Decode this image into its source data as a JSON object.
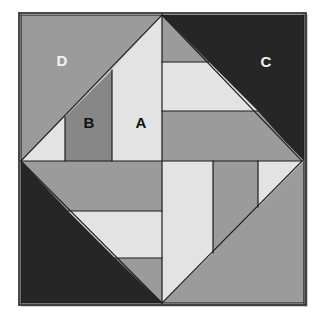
{
  "figure": {
    "canvas": {
      "width": 327,
      "height": 322,
      "background": "#ffffff"
    },
    "frame": {
      "name": "outer-square-border",
      "x": 19,
      "y": 13,
      "width": 287,
      "height": 292,
      "stroke": "#1c1c1c",
      "stroke_width": 1.6,
      "shadow": "#cfcfcf"
    },
    "palette": {
      "dark": "#262626",
      "medium_gray": "#9b9b9b",
      "mid_dark_gray": "#878787",
      "light": "#e3e3e3",
      "outline": "#1c1c1c",
      "label_light": "#f2f2f2",
      "label_dark": "#111111",
      "page_background": "#ffffff"
    },
    "diamond": {
      "name": "inner-rotated-square",
      "top": [
        162,
        15
      ],
      "left": [
        21,
        161
      ],
      "right": [
        302,
        161
      ],
      "bottom": [
        162,
        303
      ]
    },
    "corner_triangles": [
      {
        "name": "corner-triangle-upper-left",
        "label": "D",
        "fill": "#9b9b9b",
        "points": "21,15 162,15 21,161",
        "label_x": 62,
        "label_y": 62,
        "label_color": "#f2f2f2"
      },
      {
        "name": "corner-triangle-upper-right",
        "label": "C",
        "fill": "#262626",
        "points": "162,15 304,15 304,161",
        "label_x": 266,
        "label_y": 63,
        "label_color": "#f2f2f2"
      },
      {
        "name": "corner-triangle-lower-left",
        "label": "",
        "fill": "#262626",
        "points": "21,161 162,303 21,303",
        "label_x": 62,
        "label_y": 258,
        "label_color": "#f2f2f2"
      },
      {
        "name": "corner-triangle-lower-right",
        "label": "",
        "fill": "#9b9b9b",
        "points": "304,161 304,303 162,303",
        "label_x": 264,
        "label_y": 258,
        "label_color": "#111111"
      }
    ],
    "quadrant_pieces": [
      {
        "name": "piece-upper-left-outer-triangle",
        "label": "",
        "fill": "#e3e3e3",
        "points": "21,161 65,117 65,161",
        "label_x": 0,
        "label_y": 0,
        "label_color": "#111111"
      },
      {
        "name": "piece-upper-left-b",
        "label": "B",
        "fill": "#878787",
        "points": "65,117 112,70 112,161 65,161",
        "label_x": 89,
        "label_y": 124,
        "label_color": "#111111"
      },
      {
        "name": "piece-upper-left-a",
        "label": "A",
        "fill": "#e3e3e3",
        "points": "112,70 162,15 162,161 112,161",
        "label_x": 141,
        "label_y": 124,
        "label_color": "#111111"
      },
      {
        "name": "piece-upper-right-strip-top",
        "label": "",
        "fill": "#9b9b9b",
        "points": "162,15 209,62 162,62",
        "label_x": 0,
        "label_y": 0,
        "label_color": "#111111"
      },
      {
        "name": "piece-upper-right-strip-middle",
        "label": "",
        "fill": "#e3e3e3",
        "points": "162,62 209,62 258,111 162,111",
        "label_x": 0,
        "label_y": 0,
        "label_color": "#111111"
      },
      {
        "name": "piece-upper-right-strip-bottom",
        "label": "",
        "fill": "#9b9b9b",
        "points": "162,111 258,111 302,161 162,161",
        "label_x": 0,
        "label_y": 0,
        "label_color": "#111111"
      },
      {
        "name": "piece-lower-left-strip-top",
        "label": "",
        "fill": "#9b9b9b",
        "points": "21,161 162,161 162,211 68,211",
        "label_x": 0,
        "label_y": 0,
        "label_color": "#111111"
      },
      {
        "name": "piece-lower-left-strip-middle",
        "label": "",
        "fill": "#e3e3e3",
        "points": "68,211 162,211 162,258 115,258",
        "label_x": 0,
        "label_y": 0,
        "label_color": "#111111"
      },
      {
        "name": "piece-lower-left-strip-bottom",
        "label": "",
        "fill": "#9b9b9b",
        "points": "115,258 162,258 162,303",
        "label_x": 0,
        "label_y": 0,
        "label_color": "#111111"
      },
      {
        "name": "piece-lower-right-strip-left",
        "label": "",
        "fill": "#e3e3e3",
        "points": "162,161 213,161 213,253 162,303",
        "label_x": 0,
        "label_y": 0,
        "label_color": "#111111"
      },
      {
        "name": "piece-lower-right-strip-middle",
        "label": "",
        "fill": "#9b9b9b",
        "points": "213,161 258,161 258,207 213,253",
        "label_x": 0,
        "label_y": 0,
        "label_color": "#111111"
      },
      {
        "name": "piece-lower-right-strip-right",
        "label": "",
        "fill": "#e3e3e3",
        "points": "258,161 302,161 258,207",
        "label_x": 0,
        "label_y": 0,
        "label_color": "#111111"
      }
    ],
    "labels": [
      {
        "name": "label-a",
        "text": "A",
        "x": 141,
        "y": 124,
        "color": "#111111"
      },
      {
        "name": "label-b",
        "text": "B",
        "x": 89,
        "y": 124,
        "color": "#111111"
      },
      {
        "name": "label-c",
        "text": "C",
        "x": 266,
        "y": 63,
        "color": "#f2f2f2"
      },
      {
        "name": "label-d",
        "text": "D",
        "x": 62,
        "y": 62,
        "color": "#f2f2f2"
      }
    ],
    "edges": [
      "21,15 162,15 304,15",
      "21,161 302,161",
      "162,15 162,303",
      "21,15 21,303",
      "304,15 304,303",
      "21,303 304,303",
      "21,161 162,15",
      "162,15 302,161",
      "302,161 162,303",
      "162,303 21,161",
      "65,117 65,161",
      "112,70 112,161",
      "162,62 209,62",
      "162,111 258,111",
      "68,211 162,211",
      "115,258 162,258",
      "213,161 213,253",
      "258,161 258,207"
    ]
  }
}
